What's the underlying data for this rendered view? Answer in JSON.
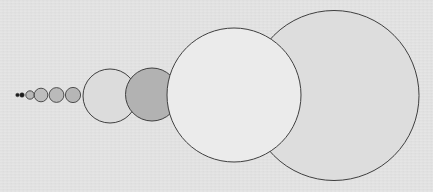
{
  "diagram": {
    "title": "",
    "background": "#e3e3e3",
    "stroke": "#3f3f3f",
    "circles": [
      {
        "id": "dot-1",
        "cx": 17.5,
        "cy": 95,
        "r": 1.8,
        "fill": "#1a1a1a",
        "stroke_width": 0.5
      },
      {
        "id": "dot-2",
        "cx": 22,
        "cy": 95,
        "r": 2.3,
        "fill": "#1a1a1a",
        "stroke_width": 0.5
      },
      {
        "id": "circle-3",
        "cx": 30,
        "cy": 95,
        "r": 4.2,
        "fill": "#b8b8b8",
        "stroke_width": 0.9
      },
      {
        "id": "circle-4",
        "cx": 41,
        "cy": 95,
        "r": 6.8,
        "fill": "#bdbdbd",
        "stroke_width": 0.9
      },
      {
        "id": "circle-5",
        "cx": 56.5,
        "cy": 95,
        "r": 7.4,
        "fill": "#bababa",
        "stroke_width": 0.9
      },
      {
        "id": "circle-6",
        "cx": 73,
        "cy": 95,
        "r": 7.6,
        "fill": "#b6b6b6",
        "stroke_width": 0.9
      },
      {
        "id": "circle-7",
        "cx": 110,
        "cy": 96,
        "r": 27,
        "fill": "#dcdcdc",
        "stroke_width": 1
      },
      {
        "id": "circle-8",
        "cx": 152,
        "cy": 94.5,
        "r": 26.5,
        "fill": "#b2b2b2",
        "stroke_width": 1
      },
      {
        "id": "circle-10",
        "cx": 334,
        "cy": 95.5,
        "r": 85,
        "fill": "#dddddd",
        "stroke_width": 1
      },
      {
        "id": "circle-9",
        "cx": 234,
        "cy": 95,
        "r": 67,
        "fill": "#ebebeb",
        "stroke_width": 1
      }
    ]
  }
}
